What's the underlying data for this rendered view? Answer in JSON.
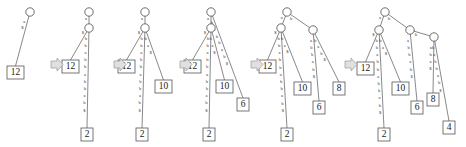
{
  "figure": {
    "alphabet": [
      "a",
      "b",
      "$"
    ],
    "panel_count": 6,
    "arrow_glyph": "right-arrow",
    "colors": {
      "edge": "#6b6b6b",
      "node_stroke": "#4a4a4a",
      "node_fill": "#ffffff",
      "box_stroke": "#555555",
      "text": "#1a1a1a",
      "label": "#3a3a3a",
      "arrow_fill": "#e0e0e0",
      "arrow_stroke": "#9a9a9a"
    }
  },
  "panels": [
    {
      "id": "panel-1",
      "step": 1,
      "origin_x": 10,
      "origin_y": 12,
      "root": {
        "cx": 30,
        "cy": 12,
        "r": 4.2,
        "visible": true
      },
      "internal_nodes": [],
      "edges": [
        {
          "from": "root",
          "to": "leaf-12",
          "label": "a $",
          "chars": [
            "a",
            "$"
          ]
        }
      ],
      "leaves": [
        {
          "value": "12",
          "x": 7,
          "y": 66
        }
      ]
    },
    {
      "id": "panel-2",
      "step": 2,
      "origin_x": 75,
      "origin_y": 12,
      "root": {
        "cx": 89,
        "cy": 12,
        "r": 4.2,
        "visible": true
      },
      "internal_nodes": [
        {
          "id": "n1",
          "cx": 89,
          "cy": 28,
          "r": 4.2
        }
      ],
      "edges": [
        {
          "from": "root",
          "to": "n1",
          "label": "a",
          "chars": [
            "a"
          ]
        },
        {
          "from": "n1",
          "to": "leaf-12",
          "label": "$",
          "chars": [
            "$"
          ]
        },
        {
          "from": "n1",
          "to": "leaf-2",
          "label": "b b a b b a b b a b $",
          "chars": [
            "b",
            "b",
            "a",
            "b",
            "b",
            "a",
            "b",
            "b",
            "a",
            "b",
            "$"
          ]
        }
      ],
      "leaves": [
        {
          "value": "12",
          "x": 62,
          "y": 60
        },
        {
          "value": "2",
          "x": 81,
          "y": 128
        }
      ]
    },
    {
      "id": "panel-3",
      "step": 3,
      "origin_x": 140,
      "origin_y": 12,
      "root": {
        "cx": 145,
        "cy": 12,
        "r": 4.2,
        "visible": true
      },
      "internal_nodes": [
        {
          "id": "n1",
          "cx": 145,
          "cy": 28,
          "r": 4.2
        }
      ],
      "edges": [
        {
          "from": "root",
          "to": "n1",
          "label": "a",
          "chars": [
            "a"
          ]
        },
        {
          "from": "n1",
          "to": "leaf-12",
          "label": "$",
          "chars": [
            "$"
          ]
        },
        {
          "from": "n1",
          "to": "leaf-2",
          "label": "b b a b b a b b a b $",
          "chars": [
            "b",
            "b",
            "a",
            "b",
            "b",
            "a",
            "b",
            "b",
            "a",
            "b",
            "$"
          ]
        },
        {
          "from": "n1",
          "to": "leaf-10",
          "label": "b a $",
          "chars": [
            "b",
            "a",
            "$"
          ]
        }
      ],
      "leaves": [
        {
          "value": "12",
          "x": 118,
          "y": 60
        },
        {
          "value": "2",
          "x": 136,
          "y": 128
        },
        {
          "value": "10",
          "x": 155,
          "y": 80
        }
      ]
    },
    {
      "id": "panel-4",
      "step": 4,
      "origin_x": 205,
      "origin_y": 12,
      "root": {
        "cx": 211,
        "cy": 12,
        "r": 4.2,
        "visible": true
      },
      "internal_nodes": [
        {
          "id": "n1",
          "cx": 211,
          "cy": 28,
          "r": 4.2
        }
      ],
      "edges": [
        {
          "from": "root",
          "to": "n1",
          "label": "a",
          "chars": [
            "a"
          ]
        },
        {
          "from": "n1",
          "to": "leaf-12",
          "label": "$",
          "chars": [
            "$"
          ]
        },
        {
          "from": "n1",
          "to": "leaf-2",
          "label": "b b a b b a b b a b $",
          "chars": [
            "b",
            "b",
            "a",
            "b",
            "b",
            "a",
            "b",
            "b",
            "a",
            "b",
            "$"
          ]
        },
        {
          "from": "n1",
          "to": "leaf-10",
          "label": "b a $",
          "chars": [
            "b",
            "a",
            "$"
          ]
        },
        {
          "from": "root",
          "to": "leaf-6",
          "label": "b a b b a b $",
          "chars": [
            "b",
            "a",
            "b",
            "b",
            "a",
            "b",
            "$"
          ]
        }
      ],
      "leaves": [
        {
          "value": "12",
          "x": 184,
          "y": 60
        },
        {
          "value": "2",
          "x": 203,
          "y": 128
        },
        {
          "value": "10",
          "x": 216,
          "y": 80
        },
        {
          "value": "6",
          "x": 237,
          "y": 98
        }
      ]
    },
    {
      "id": "panel-5",
      "step": 5,
      "origin_x": 268,
      "origin_y": 12,
      "root": {
        "cx": 287,
        "cy": 12,
        "r": 4.2,
        "visible": true
      },
      "internal_nodes": [
        {
          "id": "n1",
          "cx": 281,
          "cy": 28,
          "r": 4.2
        },
        {
          "id": "n2",
          "cx": 313,
          "cy": 30,
          "r": 4.2
        }
      ],
      "edges": [
        {
          "from": "root",
          "to": "n1",
          "label": "a",
          "chars": [
            "a"
          ]
        },
        {
          "from": "root",
          "to": "n2",
          "label": "b",
          "chars": [
            "b"
          ]
        },
        {
          "from": "n1",
          "to": "leaf-12",
          "label": "$",
          "chars": [
            "$"
          ]
        },
        {
          "from": "n1",
          "to": "leaf-2",
          "label": "b b a b b a b b a b $",
          "chars": [
            "b",
            "b",
            "a",
            "b",
            "b",
            "a",
            "b",
            "b",
            "a",
            "b",
            "$"
          ]
        },
        {
          "from": "n1",
          "to": "leaf-10",
          "label": "b a $",
          "chars": [
            "b",
            "a",
            "$"
          ]
        },
        {
          "from": "n2",
          "to": "leaf-6",
          "label": "a b b a b $",
          "chars": [
            "a",
            "b",
            "b",
            "a",
            "b",
            "$"
          ]
        },
        {
          "from": "n2",
          "to": "leaf-8",
          "label": "b a b $",
          "chars": [
            "b",
            "a",
            "b",
            "$"
          ]
        }
      ],
      "leaves": [
        {
          "value": "12",
          "x": 259,
          "y": 60
        },
        {
          "value": "2",
          "x": 281,
          "y": 128
        },
        {
          "value": "10",
          "x": 294,
          "y": 82
        },
        {
          "value": "6",
          "x": 313,
          "y": 101
        },
        {
          "value": "8",
          "x": 333,
          "y": 82
        }
      ]
    },
    {
      "id": "panel-6",
      "step": 6,
      "origin_x": 360,
      "origin_y": 12,
      "root": {
        "cx": 385,
        "cy": 12,
        "r": 4.2,
        "visible": true
      },
      "internal_nodes": [
        {
          "id": "n1",
          "cx": 379,
          "cy": 30,
          "r": 4.2
        },
        {
          "id": "n2",
          "cx": 410,
          "cy": 30,
          "r": 4.2
        },
        {
          "id": "n3",
          "cx": 434,
          "cy": 37,
          "r": 4.2
        }
      ],
      "edges": [
        {
          "from": "root",
          "to": "n1",
          "label": "a",
          "chars": [
            "a"
          ]
        },
        {
          "from": "root",
          "to": "n2",
          "label": "b",
          "chars": [
            "b"
          ]
        },
        {
          "from": "n1",
          "to": "leaf-12",
          "label": "$",
          "chars": [
            "$"
          ]
        },
        {
          "from": "n1",
          "to": "leaf-2",
          "label": "b b a b b a b b a b $",
          "chars": [
            "b",
            "b",
            "a",
            "b",
            "b",
            "a",
            "b",
            "b",
            "a",
            "b",
            "$"
          ]
        },
        {
          "from": "n1",
          "to": "leaf-10",
          "label": "b a $",
          "chars": [
            "b",
            "a",
            "$"
          ]
        },
        {
          "from": "n2",
          "to": "leaf-6",
          "label": "a b b a b $",
          "chars": [
            "a",
            "b",
            "b",
            "a",
            "b",
            "$"
          ]
        },
        {
          "from": "n2",
          "to": "n3",
          "label": "b",
          "chars": [
            "b"
          ]
        },
        {
          "from": "n3",
          "to": "leaf-8",
          "label": "a b a $",
          "chars": [
            "a",
            "b",
            "a",
            "$"
          ]
        },
        {
          "from": "n3",
          "to": "leaf-4",
          "label": "b a b b a b $",
          "chars": [
            "b",
            "a",
            "b",
            "b",
            "a",
            "b",
            "$"
          ]
        }
      ],
      "leaves": [
        {
          "value": "12",
          "x": 357,
          "y": 62
        },
        {
          "value": "2",
          "x": 378,
          "y": 128
        },
        {
          "value": "10",
          "x": 392,
          "y": 82
        },
        {
          "value": "6",
          "x": 411,
          "y": 101
        },
        {
          "value": "8",
          "x": 427,
          "y": 93
        },
        {
          "value": "4",
          "x": 443,
          "y": 121
        }
      ]
    }
  ],
  "arrows": [
    {
      "id": "arrow-1",
      "x": 51,
      "y": 58
    },
    {
      "id": "arrow-2",
      "x": 114,
      "y": 58
    },
    {
      "id": "arrow-3",
      "x": 180,
      "y": 58
    },
    {
      "id": "arrow-4",
      "x": 251,
      "y": 58
    },
    {
      "id": "arrow-5",
      "x": 345,
      "y": 58
    }
  ]
}
